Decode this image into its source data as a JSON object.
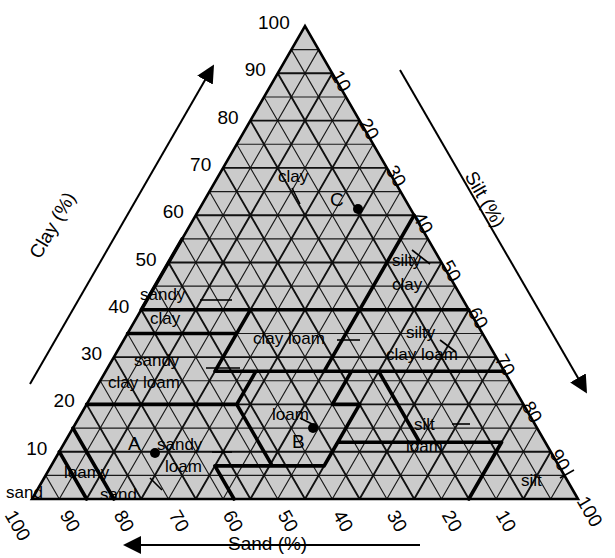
{
  "chart_data": {
    "type": "ternary",
    "axes": [
      {
        "name": "Clay (%)",
        "position": "left",
        "direction": "up-right",
        "ticks": [
          10,
          20,
          30,
          40,
          50,
          60,
          70,
          80,
          90,
          100
        ]
      },
      {
        "name": "Silt (%)",
        "position": "right",
        "direction": "down-right",
        "ticks": [
          10,
          20,
          30,
          40,
          50,
          60,
          70,
          80,
          90,
          100
        ]
      },
      {
        "name": "Sand (%)",
        "position": "bottom",
        "direction": "left",
        "ticks": [
          100,
          90,
          80,
          70,
          60,
          50,
          40,
          30,
          20,
          10
        ]
      }
    ],
    "grid": {
      "interval": 5,
      "shown": true
    },
    "classes": [
      {
        "id": "clay",
        "label": "clay"
      },
      {
        "id": "sandy-clay",
        "label": "sandy\nclay"
      },
      {
        "id": "silty-clay",
        "label": "silty\nclay"
      },
      {
        "id": "sandy-clay-loam",
        "label": "sandy\nclay loam"
      },
      {
        "id": "clay-loam",
        "label": "clay loam"
      },
      {
        "id": "silty-clay-loam",
        "label": "silty\nclay loam"
      },
      {
        "id": "sandy-loam",
        "label": "sandy\nloam"
      },
      {
        "id": "loam",
        "label": "loam"
      },
      {
        "id": "silt-loam",
        "label": "silt\nloam"
      },
      {
        "id": "loamy-sand",
        "label": "loamy\nsand"
      },
      {
        "id": "sand",
        "label": "sand"
      },
      {
        "id": "silt",
        "label": "silt"
      }
    ],
    "points": [
      {
        "label": "A",
        "sand": 65,
        "silt": 25,
        "clay": 10
      },
      {
        "label": "B",
        "sand": 40,
        "silt": 40,
        "clay": 20
      },
      {
        "label": "C",
        "sand": 25,
        "silt": 30,
        "clay": 45
      }
    ]
  },
  "axes": {
    "clay": {
      "name": "Clay (%)"
    },
    "silt": {
      "name": "Silt (%)"
    },
    "sand": {
      "name": "Sand (%)"
    }
  },
  "clay_ticks": [
    "10",
    "20",
    "30",
    "40",
    "50",
    "60",
    "70",
    "80",
    "90",
    "100"
  ],
  "silt_ticks": [
    "10",
    "20",
    "30",
    "40",
    "50",
    "60",
    "70",
    "80",
    "90",
    "100"
  ],
  "sand_ticks": [
    "100",
    "90",
    "80",
    "70",
    "60",
    "50",
    "40",
    "30",
    "20",
    "10"
  ],
  "labels": {
    "clay": "clay",
    "sandy_clay_1": "sandy",
    "sandy_clay_2": "clay",
    "silty_clay_1": "silty",
    "silty_clay_2": "clay",
    "sandy_clay_loam_1": "sandy",
    "sandy_clay_loam_2": "clay loam",
    "clay_loam": "clay loam",
    "silty_clay_loam_1": "silty",
    "silty_clay_loam_2": "clay loam",
    "sandy_loam_1": "sandy",
    "sandy_loam_2": "loam",
    "loam": "loam",
    "silt_loam_1": "silt",
    "silt_loam_2": "loam",
    "loamy_sand": "loamy",
    "loamy_sand_2": "sand",
    "sand": "sand",
    "silt": "silt"
  },
  "points": {
    "a": "A",
    "b": "B",
    "c": "C"
  },
  "colors": {
    "fill": "#cccccc",
    "grid": "#1a1a1a",
    "boundary": "#000000",
    "background": "#ffffff"
  }
}
